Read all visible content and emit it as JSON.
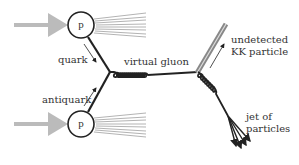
{
  "diagram": {
    "type": "feynman-diagram",
    "nodes": {
      "proton_top": {
        "label": "p"
      },
      "proton_bottom": {
        "label": "p"
      }
    },
    "labels": {
      "quark": "quark",
      "antiquark": "antiquark",
      "virtual_gluon": "virtual gluon",
      "kk_line1": "undetected",
      "kk_line2": "KK particle",
      "jet_line1": "jet of",
      "jet_line2": "particles"
    },
    "edges": [
      {
        "from": "beam-left",
        "to": "proton_top",
        "style": "gray-arrow"
      },
      {
        "from": "beam-left",
        "to": "proton_bottom",
        "style": "gray-arrow"
      },
      {
        "from": "proton_top",
        "to": "vertex1",
        "label": "quark",
        "style": "solid"
      },
      {
        "from": "proton_bottom",
        "to": "vertex1",
        "label": "antiquark",
        "style": "solid"
      },
      {
        "from": "vertex1",
        "to": "vertex2",
        "label": "virtual gluon",
        "style": "gluon-coil"
      },
      {
        "from": "vertex2",
        "to": "out-top",
        "label": "undetected KK particle",
        "style": "gray-double-line"
      },
      {
        "from": "vertex2",
        "to": "jet",
        "label": "jet of particles",
        "style": "gluon-coil-then-arrows"
      }
    ],
    "colors": {
      "line": "#222222",
      "beam": "#bbbbbb",
      "kk": "#888888",
      "spray": "#aaaaaa",
      "text": "#333333"
    }
  }
}
